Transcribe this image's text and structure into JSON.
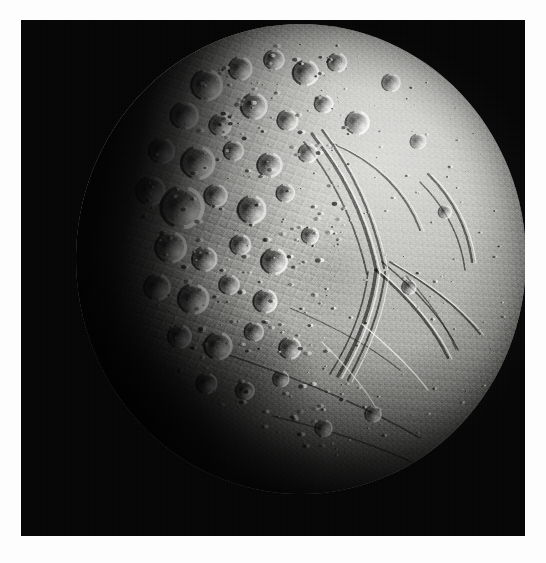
{
  "page": {
    "background_color": "#fdfdfd",
    "width": 546,
    "height": 563,
    "caption": ""
  },
  "photo": {
    "frame": {
      "left": 21,
      "top": 20,
      "width": 504,
      "height": 516,
      "background_color": "#050505",
      "border_color": "#ffffff"
    },
    "subject": "icy moon disk",
    "alt_text": "Spacecraft photograph of a cratered icy satellite, partially illuminated",
    "illumination": "lit from upper right, terminator along the left and lower-left",
    "colors": {
      "space_black": "#050505",
      "highlight_white": "#f2f2ef",
      "bright_regolith": "#d5d5d2",
      "mid_regolith": "#a9a9a6",
      "shadow_grey": "#4c4c4a",
      "terminator_black": "#020202",
      "page_white": "#fdfdfd"
    },
    "disk": {
      "center_x_pct": 58,
      "center_y_pct": 46,
      "radius_x_pct": 45,
      "radius_y_pct": 47
    },
    "terrains": [
      {
        "name": "cratered-highlands",
        "label": "heavily cratered terrain",
        "location": "upper left and left-center",
        "description": "dense overlapping impact craters with bright sunlit rims and long shadows"
      },
      {
        "name": "smooth-plains",
        "label": "smooth plains",
        "location": "right and lower right",
        "description": "sparsely cratered resurfaced plains"
      },
      {
        "name": "grooved-terrain",
        "label": "grooved / fractured terrain",
        "location": "center to lower center",
        "description": "sets of parallel curvilinear ridges and troughs"
      },
      {
        "name": "terminator-zone",
        "label": "terminator",
        "location": "left and lower left",
        "description": "day-night boundary fading into shadow"
      }
    ],
    "features": {
      "craters": [
        {
          "cx": 29.0,
          "cy": 13.0,
          "r": 3.4,
          "depth": 0.92
        },
        {
          "cx": 36.5,
          "cy": 9.5,
          "r": 2.6,
          "depth": 0.88
        },
        {
          "cx": 44.0,
          "cy": 7.6,
          "r": 2.2,
          "depth": 0.8
        },
        {
          "cx": 51.0,
          "cy": 10.4,
          "r": 2.8,
          "depth": 0.86
        },
        {
          "cx": 58.0,
          "cy": 8.2,
          "r": 2.1,
          "depth": 0.76
        },
        {
          "cx": 24.0,
          "cy": 19.5,
          "r": 3.0,
          "depth": 0.95
        },
        {
          "cx": 32.0,
          "cy": 21.5,
          "r": 2.4,
          "depth": 0.84
        },
        {
          "cx": 39.5,
          "cy": 17.5,
          "r": 2.9,
          "depth": 0.9
        },
        {
          "cx": 47.0,
          "cy": 20.5,
          "r": 2.3,
          "depth": 0.78
        },
        {
          "cx": 55.0,
          "cy": 17.0,
          "r": 2.0,
          "depth": 0.72
        },
        {
          "cx": 62.5,
          "cy": 21.0,
          "r": 2.6,
          "depth": 0.74
        },
        {
          "cx": 19.0,
          "cy": 27.0,
          "r": 2.8,
          "depth": 0.96
        },
        {
          "cx": 27.0,
          "cy": 29.5,
          "r": 3.6,
          "depth": 0.94
        },
        {
          "cx": 35.0,
          "cy": 27.0,
          "r": 2.2,
          "depth": 0.82
        },
        {
          "cx": 43.0,
          "cy": 30.0,
          "r": 2.7,
          "depth": 0.86
        },
        {
          "cx": 51.5,
          "cy": 27.5,
          "r": 2.1,
          "depth": 0.7
        },
        {
          "cx": 16.5,
          "cy": 35.5,
          "r": 3.2,
          "depth": 0.97
        },
        {
          "cx": 23.5,
          "cy": 39.0,
          "r": 4.6,
          "depth": 0.98
        },
        {
          "cx": 31.0,
          "cy": 36.5,
          "r": 2.5,
          "depth": 0.88
        },
        {
          "cx": 39.0,
          "cy": 39.5,
          "r": 3.1,
          "depth": 0.9
        },
        {
          "cx": 46.5,
          "cy": 36.0,
          "r": 2.0,
          "depth": 0.72
        },
        {
          "cx": 21.0,
          "cy": 47.5,
          "r": 3.4,
          "depth": 0.96
        },
        {
          "cx": 28.5,
          "cy": 50.0,
          "r": 2.7,
          "depth": 0.92
        },
        {
          "cx": 36.5,
          "cy": 47.0,
          "r": 2.3,
          "depth": 0.84
        },
        {
          "cx": 44.0,
          "cy": 50.5,
          "r": 2.9,
          "depth": 0.86
        },
        {
          "cx": 52.0,
          "cy": 45.0,
          "r": 1.9,
          "depth": 0.66
        },
        {
          "cx": 18.0,
          "cy": 56.0,
          "r": 2.9,
          "depth": 0.95
        },
        {
          "cx": 26.0,
          "cy": 58.5,
          "r": 3.3,
          "depth": 0.93
        },
        {
          "cx": 34.0,
          "cy": 55.5,
          "r": 2.2,
          "depth": 0.82
        },
        {
          "cx": 42.0,
          "cy": 59.0,
          "r": 2.6,
          "depth": 0.84
        },
        {
          "cx": 23.0,
          "cy": 66.5,
          "r": 2.6,
          "depth": 0.9
        },
        {
          "cx": 31.5,
          "cy": 68.5,
          "r": 3.0,
          "depth": 0.92
        },
        {
          "cx": 39.5,
          "cy": 65.5,
          "r": 2.1,
          "depth": 0.78
        },
        {
          "cx": 47.5,
          "cy": 69.0,
          "r": 2.4,
          "depth": 0.76
        },
        {
          "cx": 29.0,
          "cy": 76.5,
          "r": 2.3,
          "depth": 0.86
        },
        {
          "cx": 37.5,
          "cy": 78.0,
          "r": 2.0,
          "depth": 0.8
        },
        {
          "cx": 45.5,
          "cy": 75.5,
          "r": 1.8,
          "depth": 0.7
        },
        {
          "cx": 70.0,
          "cy": 12.5,
          "r": 2.0,
          "depth": 0.58
        },
        {
          "cx": 76.0,
          "cy": 25.0,
          "r": 1.7,
          "depth": 0.48
        },
        {
          "cx": 82.0,
          "cy": 40.0,
          "r": 1.5,
          "depth": 0.42
        },
        {
          "cx": 74.0,
          "cy": 56.0,
          "r": 1.6,
          "depth": 0.44
        },
        {
          "cx": 66.0,
          "cy": 83.0,
          "r": 1.8,
          "depth": 0.52
        },
        {
          "cx": 55.0,
          "cy": 86.0,
          "r": 1.9,
          "depth": 0.6
        }
      ],
      "grooves": [
        {
          "name": "central-groove-band",
          "path": "M 236 110 C 268 150, 290 196, 300 246"
        },
        {
          "name": "south-trending-ridge",
          "path": "M 300 246 C 296 284, 282 318, 262 352"
        },
        {
          "name": "branch-groove-a",
          "path": "M 300 246 C 330 272, 356 300, 372 334"
        },
        {
          "name": "branch-groove-b",
          "path": "M 314 238 C 348 258, 380 280, 404 310"
        },
        {
          "name": "limb-fracture",
          "path": "M 352 150 C 378 176, 392 206, 396 238"
        },
        {
          "name": "long-lineament",
          "path": "M 150 330 C 214 352, 282 378, 344 414"
        },
        {
          "name": "south-fracture",
          "path": "M 196 392 C 246 404, 300 420, 348 444"
        },
        {
          "name": "arc-scarp",
          "path": "M 258 120 C 300 138, 330 168, 344 206"
        }
      ]
    }
  }
}
